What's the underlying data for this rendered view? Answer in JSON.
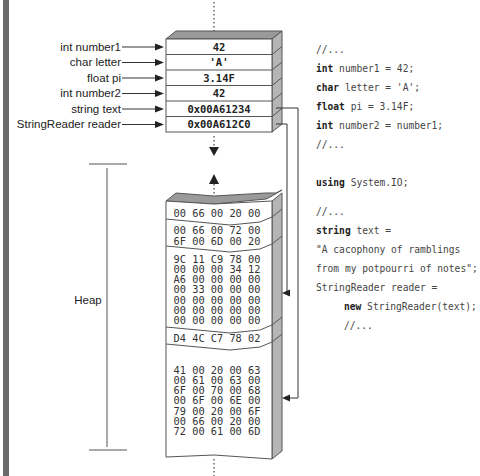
{
  "stack": {
    "variables": [
      {
        "label": "int number1",
        "value": "42"
      },
      {
        "label": "char letter",
        "value": "'A'"
      },
      {
        "label": "float pi",
        "value": "3.14F"
      },
      {
        "label": "int number2",
        "value": "42"
      },
      {
        "label": "string text",
        "value": "0x00A61234"
      },
      {
        "label": "StringReader reader",
        "value": "0x00A612C0"
      }
    ]
  },
  "heap": {
    "label": "Heap",
    "blocks": [
      {
        "rows": [
          "00 66 00 20 00"
        ]
      },
      {
        "rows": [
          "00 66 00 72 00",
          "6F 00 6D 00 20"
        ]
      },
      {
        "rows": [
          "9C 11 C9 78 00",
          "00 00 00 34 12",
          "A6 00 00 00 00",
          "00 33 00 00 00",
          "00 00 00 00 00",
          "00 00 00 00 00",
          "00 00 00 00 00"
        ]
      },
      {
        "rows": [
          "D4 4C C7 78 02"
        ]
      },
      {
        "rows": [
          "41 00 20 00 63",
          "00 61 00 63 00",
          "6F 00 70 00 68",
          "00 6F 00 6E 00",
          "79 00 20 00 6F",
          "00 66 00 20 00",
          "72 00 61 00 6D"
        ]
      }
    ]
  },
  "code": {
    "block1": [
      {
        "kw": "",
        "rest": "//..."
      },
      {
        "kw": "int",
        "rest": " number1 = 42;"
      },
      {
        "kw": "char",
        "rest": " letter = 'A';"
      },
      {
        "kw": "float",
        "rest": " pi = 3.14F;"
      },
      {
        "kw": "int",
        "rest": " number2 = number1;"
      },
      {
        "kw": "",
        "rest": "//..."
      }
    ],
    "block2": [
      {
        "kw": "using",
        "rest": " System.IO;"
      }
    ],
    "block3": [
      {
        "kw": "",
        "rest": "//...",
        "indent": 0
      },
      {
        "kw": "string",
        "rest": " text =",
        "indent": 0
      },
      {
        "kw": "",
        "rest": "\"A cacophony of ramblings",
        "indent": 0
      },
      {
        "kw": "",
        "rest": "from my potpourri of notes\";",
        "indent": 0
      },
      {
        "kw": "",
        "rest": "StringReader reader =",
        "indent": 0
      },
      {
        "kw": "new",
        "rest": " StringReader(text);",
        "indent": 1
      },
      {
        "kw": "",
        "rest": "//...",
        "indent": 1
      }
    ]
  },
  "colors": {
    "box_top": "#9a9a9a",
    "box_side": "#b5b5b5",
    "outline": "#555555",
    "left_bar": "#666666",
    "arrow": "#333333"
  }
}
